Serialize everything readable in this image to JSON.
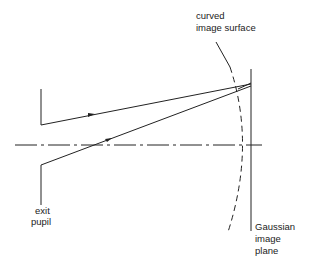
{
  "diagram": {
    "labels": {
      "curved_line1": "curved",
      "curved_line2": "image surface",
      "exit_line1": "exit",
      "exit_line2": "pupil",
      "gauss_line1": "Gaussian",
      "gauss_line2": "image",
      "gauss_line3": "plane"
    },
    "colors": {
      "ink": "#222222",
      "background": "#ffffff"
    }
  }
}
